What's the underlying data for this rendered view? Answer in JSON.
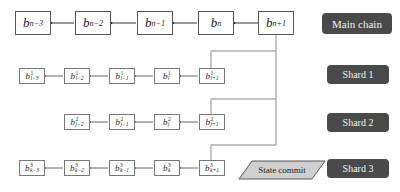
{
  "main_chain": {
    "label": "Main chain",
    "blocks": [
      {
        "base": "b",
        "sub": "n−3"
      },
      {
        "base": "b",
        "sub": "n−2"
      },
      {
        "base": "b",
        "sub": "n−1"
      },
      {
        "base": "b",
        "sub": "n"
      },
      {
        "base": "b",
        "sub": "n+1"
      }
    ]
  },
  "shards": [
    {
      "label": "Shard 1",
      "blocks": [
        {
          "base": "b",
          "sup": "1",
          "sub": "l−3"
        },
        {
          "base": "b",
          "sup": "1",
          "sub": "l−2"
        },
        {
          "base": "b",
          "sup": "1",
          "sub": "l−1"
        },
        {
          "base": "b",
          "sup": "1",
          "sub": "l"
        },
        {
          "base": "b",
          "sup": "1",
          "sub": "l+1"
        }
      ]
    },
    {
      "label": "Shard 2",
      "blocks": [
        {
          "base": "b",
          "sup": "2",
          "sub": "j−2"
        },
        {
          "base": "b",
          "sup": "2",
          "sub": "j−1"
        },
        {
          "base": "b",
          "sup": "2",
          "sub": "j"
        },
        {
          "base": "b",
          "sup": "2",
          "sub": "j+1"
        }
      ]
    },
    {
      "label": "Shard 3",
      "blocks": [
        {
          "base": "b",
          "sup": "3",
          "sub": "k−3"
        },
        {
          "base": "b",
          "sup": "3",
          "sub": "k−2"
        },
        {
          "base": "b",
          "sup": "3",
          "sub": "k−1"
        },
        {
          "base": "b",
          "sup": "3",
          "sub": "k"
        },
        {
          "base": "b",
          "sup": "3",
          "sub": "k+1"
        }
      ]
    }
  ],
  "state_commit": {
    "label": "State commit"
  },
  "colors": {
    "label_bg": "#4a4a4a",
    "label_text": "#f2f2f2",
    "commit_fill": "#cfcfcf",
    "line": "#777777"
  }
}
